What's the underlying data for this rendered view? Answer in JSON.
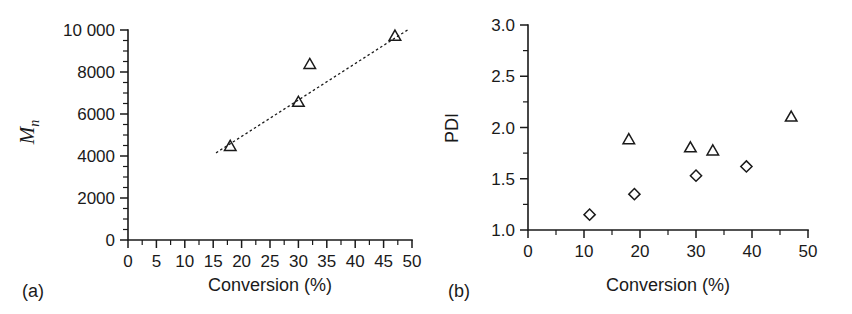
{
  "figure": {
    "background": "#ffffff",
    "ink": "#1a1a1a"
  },
  "panels": [
    {
      "tag": "(a)",
      "xlabel": "Conversion (%)",
      "ylabel": "M",
      "ylabel_sub": "n"
    },
    {
      "tag": "(b)",
      "xlabel": "Conversion (%)",
      "ylabel": "PDI"
    }
  ],
  "chart_data": [
    {
      "type": "scatter",
      "panel": "(a)",
      "title": "",
      "xlabel": "Conversion (%)",
      "ylabel": "Mn",
      "xlim": [
        0,
        50
      ],
      "ylim": [
        0,
        10000
      ],
      "grid": false,
      "legend": "none",
      "xticks": [
        0,
        5,
        10,
        15,
        20,
        25,
        30,
        35,
        40,
        45,
        50
      ],
      "xticklabels": [
        "0",
        "5",
        "10",
        "15",
        "20",
        "25",
        "30",
        "35",
        "40",
        "45",
        "50"
      ],
      "xminor_step": 2.5,
      "yticks": [
        0,
        2000,
        4000,
        6000,
        8000,
        10000
      ],
      "yticklabels": [
        "0",
        "2000",
        "4000",
        "6000",
        "8000",
        "10 000"
      ],
      "yminor_step": 500,
      "series": [
        {
          "name": "Mn",
          "marker": "triangle",
          "x": [
            18,
            30,
            32,
            47
          ],
          "y": [
            4450,
            6550,
            8350,
            9700
          ]
        }
      ],
      "fit_line": {
        "style": "dotted",
        "x": [
          15.5,
          49.5
        ],
        "y": [
          4150,
          10050
        ]
      }
    },
    {
      "type": "scatter",
      "panel": "(b)",
      "title": "",
      "xlabel": "Conversion (%)",
      "ylabel": "PDI",
      "xlim": [
        0,
        50
      ],
      "ylim": [
        1.0,
        3.0
      ],
      "grid": false,
      "legend": "none",
      "xticks": [
        0,
        10,
        20,
        30,
        40,
        50
      ],
      "xticklabels": [
        "0",
        "10",
        "20",
        "30",
        "40",
        "50"
      ],
      "xminor_step": 5,
      "yticks": [
        1.0,
        1.5,
        2.0,
        2.5,
        3.0
      ],
      "yticklabels": [
        "1.0",
        "1.5",
        "2.0",
        "2.5",
        "3.0"
      ],
      "yminor_step": 0.25,
      "series": [
        {
          "name": "PDI-triangles",
          "marker": "triangle",
          "x": [
            18,
            29,
            33,
            47
          ],
          "y": [
            1.88,
            1.8,
            1.77,
            2.1
          ]
        },
        {
          "name": "PDI-diamonds",
          "marker": "diamond",
          "x": [
            11,
            19,
            30,
            39
          ],
          "y": [
            1.15,
            1.35,
            1.53,
            1.62
          ]
        }
      ]
    }
  ]
}
